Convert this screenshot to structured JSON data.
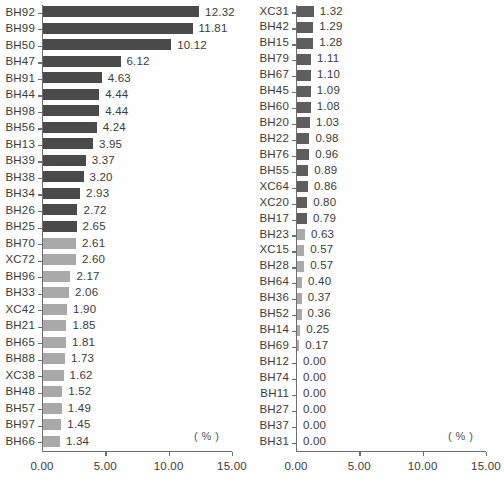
{
  "figure": {
    "unit_label": "( % )",
    "colors": {
      "bar_dark": "#4a4a4a",
      "bar_medium": "#5e5e5e",
      "bar_light": "#a9a9a9",
      "axis": "#6e6e6e",
      "text": "#3c3c3c",
      "background": "#fefefe"
    }
  },
  "chart_data": [
    {
      "type": "bar",
      "title": "",
      "orientation": "horizontal",
      "xlabel": "( % )",
      "ylabel": "",
      "xlim": [
        0,
        15
      ],
      "xticks": [
        0,
        5,
        10,
        15
      ],
      "xtick_labels": [
        "0.00",
        "5.00",
        "10.00",
        "15.00"
      ],
      "grid": false,
      "legend": "none",
      "panel": "left",
      "categories": [
        "BH92",
        "BH99",
        "BH50",
        "BH47",
        "BH91",
        "BH44",
        "BH98",
        "BH56",
        "BH13",
        "BH39",
        "BH38",
        "BH34",
        "BH26",
        "BH25",
        "BH70",
        "XC72",
        "BH96",
        "BH33",
        "XC42",
        "BH21",
        "BH65",
        "BH88",
        "XC38",
        "BH48",
        "BH57",
        "BH97",
        "BH66"
      ],
      "values": [
        12.32,
        11.81,
        10.12,
        6.12,
        4.63,
        4.44,
        4.44,
        4.24,
        3.95,
        3.37,
        3.2,
        2.93,
        2.72,
        2.65,
        2.61,
        2.6,
        2.17,
        2.06,
        1.9,
        1.85,
        1.81,
        1.73,
        1.62,
        1.52,
        1.49,
        1.45,
        1.34
      ],
      "value_labels": [
        "12.32",
        "11.81",
        "10.12",
        "6.12",
        "4.63",
        "4.44",
        "4.44",
        "4.24",
        "3.95",
        "3.37",
        "3.20",
        "2.93",
        "2.72",
        "2.65",
        "2.61",
        "2.60",
        "2.17",
        "2.06",
        "1.90",
        "1.85",
        "1.81",
        "1.73",
        "1.62",
        "1.52",
        "1.49",
        "1.45",
        "1.34"
      ],
      "bar_colors": [
        "#4a4a4a",
        "#4a4a4a",
        "#4a4a4a",
        "#4a4a4a",
        "#4a4a4a",
        "#4a4a4a",
        "#4a4a4a",
        "#4a4a4a",
        "#4a4a4a",
        "#4a4a4a",
        "#4a4a4a",
        "#4a4a4a",
        "#4a4a4a",
        "#4a4a4a",
        "#a9a9a9",
        "#a9a9a9",
        "#a9a9a9",
        "#a9a9a9",
        "#a9a9a9",
        "#a9a9a9",
        "#a9a9a9",
        "#a9a9a9",
        "#a9a9a9",
        "#a9a9a9",
        "#a9a9a9",
        "#a9a9a9",
        "#a9a9a9"
      ]
    },
    {
      "type": "bar",
      "title": "",
      "orientation": "horizontal",
      "xlabel": "( % )",
      "ylabel": "",
      "xlim": [
        0,
        15
      ],
      "xticks": [
        0,
        5,
        10,
        15
      ],
      "xtick_labels": [
        "0.00",
        "5.00",
        "10.00",
        "15.00"
      ],
      "grid": false,
      "legend": "none",
      "panel": "right",
      "categories": [
        "XC31",
        "BH42",
        "BH15",
        "BH79",
        "BH67",
        "BH45",
        "BH60",
        "BH20",
        "BH22",
        "BH76",
        "BH55",
        "XC64",
        "XC20",
        "BH17",
        "BH23",
        "XC15",
        "BH28",
        "BH64",
        "BH36",
        "BH52",
        "BH14",
        "BH69",
        "BH12",
        "BH74",
        "BH11",
        "BH27",
        "BH37",
        "BH31"
      ],
      "values": [
        1.32,
        1.29,
        1.28,
        1.11,
        1.1,
        1.09,
        1.08,
        1.03,
        0.98,
        0.96,
        0.89,
        0.86,
        0.8,
        0.79,
        0.63,
        0.57,
        0.57,
        0.4,
        0.37,
        0.36,
        0.25,
        0.17,
        0.0,
        0.0,
        0.0,
        0.0,
        0.0,
        0.0
      ],
      "value_labels": [
        "1.32",
        "1.29",
        "1.28",
        "1.11",
        "1.10",
        "1.09",
        "1.08",
        "1.03",
        "0.98",
        "0.96",
        "0.89",
        "0.86",
        "0.80",
        "0.79",
        "0.63",
        "0.57",
        "0.57",
        "0.40",
        "0.37",
        "0.36",
        "0.25",
        "0.17",
        "0.00",
        "0.00",
        "0.00",
        "0.00",
        "0.00",
        "0.00"
      ],
      "bar_colors": [
        "#5e5e5e",
        "#5e5e5e",
        "#5e5e5e",
        "#5e5e5e",
        "#5e5e5e",
        "#5e5e5e",
        "#5e5e5e",
        "#5e5e5e",
        "#5e5e5e",
        "#5e5e5e",
        "#5e5e5e",
        "#5e5e5e",
        "#5e5e5e",
        "#5e5e5e",
        "#a9a9a9",
        "#a9a9a9",
        "#a9a9a9",
        "#a9a9a9",
        "#a9a9a9",
        "#a9a9a9",
        "#a9a9a9",
        "#a9a9a9",
        "#a9a9a9",
        "#a9a9a9",
        "#a9a9a9",
        "#a9a9a9",
        "#a9a9a9",
        "#a9a9a9"
      ]
    }
  ]
}
